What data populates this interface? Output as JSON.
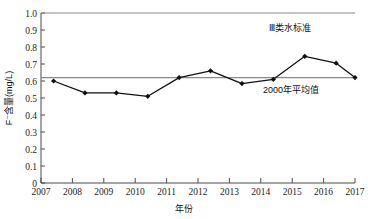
{
  "chart_data": {
    "type": "line",
    "title": "",
    "xlabel": "年份",
    "ylabel": "F⁻含量(mg/L)",
    "xlim": [
      2007,
      2017
    ],
    "ylim": [
      0,
      1.0
    ],
    "grid": false,
    "legend": "none",
    "x_tick_labels": [
      "2007",
      "2008",
      "2009",
      "2010",
      "2011",
      "2012",
      "2013",
      "2014",
      "2015",
      "2016",
      "2017"
    ],
    "y_tick_labels": [
      "0",
      "0.1",
      "0.2",
      "0.3",
      "0.4",
      "0.5",
      "0.6",
      "0.7",
      "0.8",
      "0.9",
      "1.0"
    ],
    "x": [
      2007.4,
      2008.4,
      2009.4,
      2010.4,
      2011.4,
      2012.4,
      2013.4,
      2014.4,
      2015.4,
      2016.4,
      2017.0
    ],
    "series": [
      {
        "name": "F⁻含量",
        "marker": "diamond",
        "color": "#111111",
        "values": [
          0.6,
          0.53,
          0.53,
          0.51,
          0.62,
          0.66,
          0.585,
          0.61,
          0.745,
          0.705,
          0.62
        ]
      }
    ],
    "reference_lines": [
      {
        "name": "class-iii-water-standard",
        "label": "Ⅲ类水标准",
        "value": 1.0,
        "color": "#8a8a8a"
      },
      {
        "name": "year-2000-average",
        "label": "2000年平均值",
        "value": 0.62,
        "color": "#8a8a8a"
      }
    ],
    "annotations": [
      {
        "text": "Ⅲ类水标准",
        "x": 2015.2,
        "y": 0.885
      },
      {
        "text": "2000年平均值",
        "x": 2015.1,
        "y": 0.535
      }
    ]
  },
  "labels": {
    "x_axis_title": "年份",
    "y_axis_title": "F⁻含量(mg/L)",
    "annotation_standard": "Ⅲ类水标准",
    "annotation_average": "2000年平均值"
  }
}
